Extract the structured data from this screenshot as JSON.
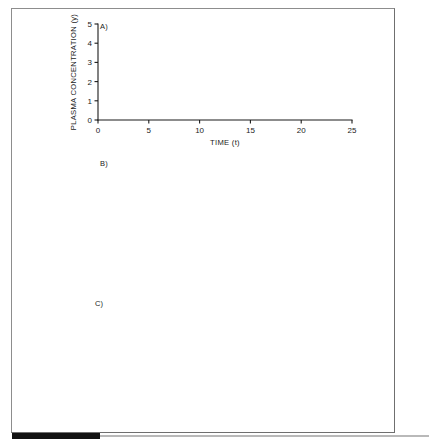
{
  "figure": {
    "background_color": "#ffffff",
    "ink_color": "#101010",
    "border_color": "#8d8d8d"
  },
  "panels": [
    {
      "letter": "A)",
      "xlabel": "TIME (t)",
      "ylabel": "PLASMA CONCENTRATION (y)",
      "xticks": [
        0,
        5,
        10,
        15,
        20,
        25
      ],
      "yticks": [
        0,
        1,
        2,
        3,
        4,
        5
      ],
      "xlim": [
        0,
        25
      ],
      "ylim": [
        0,
        5
      ]
    },
    {
      "letter": "B)",
      "xlabel": "TIME (t)",
      "ylabel": "PLASMA CONCENTRATION (y)",
      "xticks": [
        0,
        5,
        10,
        15,
        20,
        25
      ],
      "yticks": [
        0,
        1,
        2,
        3,
        4
      ],
      "xlim": [
        0,
        25
      ],
      "ylim": [
        0,
        4
      ]
    },
    {
      "letter": "C)",
      "xlabel": "TIME (days)",
      "ylabel": "PLASMA CONCENTRATION (ng/ml)",
      "xticks": [
        0,
        4,
        8,
        12,
        16,
        20,
        24
      ],
      "yticks": [
        0,
        10,
        20,
        30
      ],
      "xlim": [
        0,
        24
      ],
      "ylim": [
        0,
        30
      ],
      "annotations": [
        {
          "text": "TOXIC",
          "x": 21.2,
          "y": 25.6
        },
        {
          "text": "THERAPEUTIC",
          "x": 17.6,
          "y": 13.4
        },
        {
          "text": "#1",
          "x": 23.1,
          "y": 22.6
        },
        {
          "text": "#2",
          "x": 23.1,
          "y": 16.3
        }
      ]
    }
  ],
  "chart_data": [
    {
      "type": "line",
      "panel": "A)",
      "title": "",
      "xlabel": "TIME (t)",
      "ylabel": "PLASMA CONCENTRATION (y)",
      "xlim": [
        0,
        25
      ],
      "ylim": [
        0,
        5
      ],
      "xticks": [
        0,
        5,
        10,
        15,
        20,
        25
      ],
      "yticks": [
        0,
        1,
        2,
        3,
        4,
        5
      ],
      "grid": false,
      "legend": "none",
      "description": "Intermittent dosing with long dosing interval (tau=5) overlaid on a continuous infusion curve approaching steady state 3.25",
      "series": [
        {
          "name": "intermittent-dose",
          "dose_interval": 5,
          "n_doses": 5,
          "peaks": [
            {
              "x": 1.2,
              "y": 2.98
            },
            {
              "x": 6.1,
              "y": 3.98
            },
            {
              "x": 11.1,
              "y": 4.22
            },
            {
              "x": 16.1,
              "y": 4.36
            },
            {
              "x": 21.1,
              "y": 4.4
            }
          ],
          "troughs": [
            {
              "x": 5.0,
              "y": 1.24
            },
            {
              "x": 10.0,
              "y": 1.68
            },
            {
              "x": 15.0,
              "y": 1.8
            },
            {
              "x": 20.0,
              "y": 1.85
            },
            {
              "x": 25.0,
              "y": 1.9
            }
          ]
        },
        {
          "name": "continuous-infusion",
          "steady_state": 3.25,
          "x": [
            0,
            1,
            2,
            3,
            4,
            5,
            7.5,
            10,
            12.5,
            15,
            20,
            25
          ],
          "values": [
            0,
            0.95,
            1.62,
            2.08,
            2.4,
            2.62,
            2.98,
            3.12,
            3.2,
            3.23,
            3.25,
            3.25
          ]
        }
      ]
    },
    {
      "type": "line",
      "panel": "B)",
      "title": "",
      "xlabel": "TIME (t)",
      "ylabel": "PLASMA CONCENTRATION (y)",
      "xlim": [
        0,
        25
      ],
      "ylim": [
        0,
        4
      ],
      "xticks": [
        0,
        5,
        10,
        15,
        20,
        25
      ],
      "yticks": [
        0,
        1,
        2,
        3,
        4
      ],
      "grid": false,
      "legend": "none",
      "description": "Intermittent dosing with shorter dosing interval (tau=2.33) overlaid on a continuous infusion curve approaching steady state 3.2",
      "series": [
        {
          "name": "intermittent-dose",
          "dose_interval": 2.33,
          "n_doses": 11,
          "peaks": [
            {
              "x": 0.7,
              "y": 1.45
            },
            {
              "x": 3.0,
              "y": 2.35
            },
            {
              "x": 5.4,
              "y": 2.78
            },
            {
              "x": 7.7,
              "y": 3.05
            },
            {
              "x": 10.0,
              "y": 3.22
            },
            {
              "x": 12.4,
              "y": 3.35
            },
            {
              "x": 14.7,
              "y": 3.42
            },
            {
              "x": 17.0,
              "y": 3.48
            },
            {
              "x": 19.4,
              "y": 3.52
            },
            {
              "x": 21.7,
              "y": 3.54
            },
            {
              "x": 24.0,
              "y": 3.55
            }
          ],
          "troughs": [
            {
              "x": 2.33,
              "y": 0.95
            },
            {
              "x": 4.66,
              "y": 1.92
            },
            {
              "x": 7.0,
              "y": 2.3
            },
            {
              "x": 9.33,
              "y": 2.55
            },
            {
              "x": 11.66,
              "y": 2.68
            },
            {
              "x": 14.0,
              "y": 2.76
            },
            {
              "x": 16.33,
              "y": 2.8
            },
            {
              "x": 18.66,
              "y": 2.83
            },
            {
              "x": 21.0,
              "y": 2.85
            },
            {
              "x": 23.33,
              "y": 2.86
            },
            {
              "x": 25.0,
              "y": 2.62
            }
          ]
        },
        {
          "name": "continuous-infusion",
          "steady_state": 3.2,
          "x": [
            0,
            1,
            2,
            3,
            4,
            5,
            7.5,
            10,
            12.5,
            15,
            20,
            25
          ],
          "values": [
            0,
            0.92,
            1.58,
            2.05,
            2.38,
            2.62,
            2.97,
            3.1,
            3.16,
            3.19,
            3.2,
            3.2
          ]
        }
      ]
    },
    {
      "type": "line",
      "panel": "C)",
      "title": "",
      "xlabel": "TIME (days)",
      "ylabel": "PLASMA CONCENTRATION (ng/ml)",
      "xlim": [
        0,
        24
      ],
      "ylim": [
        0,
        30
      ],
      "xticks": [
        0,
        4,
        8,
        12,
        16,
        20,
        24
      ],
      "yticks": [
        0,
        10,
        20,
        30
      ],
      "grid": false,
      "legend": "labelled-on-curve",
      "description": "Two dosing regimens: #1 with a loading dose reaching therapeutic range immediately; #2 without loading dose, slowly accumulating. Horizontal reference lines mark TOXIC (24 ng/ml) and THERAPEUTIC (12 ng/ml) thresholds.",
      "reference_lines": [
        {
          "name": "TOXIC",
          "y": 24
        },
        {
          "name": "THERAPEUTIC",
          "y": 12
        }
      ],
      "series": [
        {
          "name": "#1",
          "loading_dose": true,
          "start_y": 12.2,
          "x": [
            0,
            0.5,
            2,
            4,
            6,
            8,
            10,
            12,
            14,
            16,
            18,
            20,
            22,
            24
          ],
          "values": [
            12.2,
            15.4,
            15.9,
            16.5,
            17.0,
            17.3,
            17.6,
            17.9,
            18.1,
            18.4,
            18.6,
            18.9,
            19.3,
            21.8
          ],
          "ripple_amplitude": 0.9
        },
        {
          "name": "#2",
          "loading_dose": false,
          "start_y": 0.5,
          "x": [
            0,
            1,
            2,
            3,
            4,
            5,
            6,
            7,
            8,
            9,
            10,
            12,
            14,
            16,
            18,
            20,
            22,
            24
          ],
          "values": [
            0.5,
            2.6,
            4.3,
            5.8,
            7.1,
            8.2,
            9.2,
            10.0,
            10.8,
            11.5,
            12.1,
            12.9,
            13.4,
            13.9,
            14.3,
            14.7,
            15.1,
            16.0
          ],
          "ripple_amplitude": 0.8
        }
      ]
    }
  ]
}
